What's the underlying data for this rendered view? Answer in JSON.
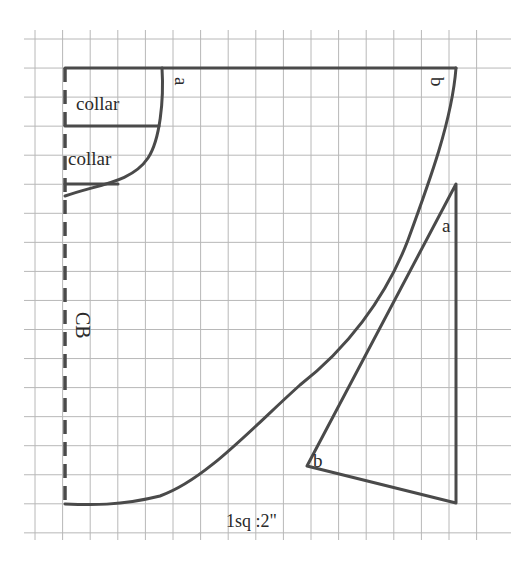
{
  "diagram": {
    "colors": {
      "ink": "#4a4a4a",
      "grid": "#b8b8b8",
      "text": "#2a2a2a",
      "background": "#ffffff"
    },
    "grid": {
      "x_start": 35,
      "x_step": 27.6,
      "x_count": 17,
      "y_start": 39,
      "y_step": 29.05,
      "y_count": 18,
      "x_min": 24,
      "x_max": 511,
      "y_min": 30,
      "y_max": 540
    },
    "labels": {
      "collar_1": "collar",
      "collar_2": "collar",
      "point_a_top": "a",
      "point_b_top": "b",
      "point_a_right": "a",
      "point_b_bottom": "b",
      "center_back": "CB",
      "scale": "1sq :2\""
    },
    "paths": {
      "top_edge": "M65 68 L456 68",
      "cb_line": "M65 68 L65 504",
      "neckline": "M162 68 C164 100 160 140 148 158 C132 182 100 184 65 196",
      "collar_divider": "M65 126 L159 126",
      "collar_bottom": "M65 184 L118 184",
      "outer_hem": "M456 68 C452 120 430 180 408 240 C385 300 345 350 300 385 C250 430 205 480 160 496 C120 506 90 505 65 504",
      "triangle": "M456 184 L456 503 L307 466 Z"
    }
  }
}
